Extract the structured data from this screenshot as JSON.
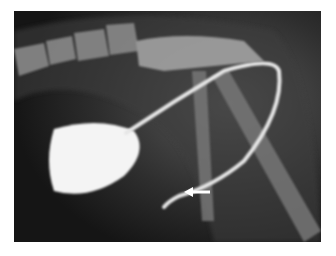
{
  "image": {
    "kind": "radiograph",
    "description": "Lateral contrast radiograph showing contrast-filled bladder and looped urethra/catheter with an arrow indicating a point of interest",
    "annotations": [
      {
        "type": "arrow",
        "direction": "left",
        "color": "#ffffff"
      }
    ]
  },
  "colors": {
    "background": "#ffffff",
    "film": "#1a1a1a",
    "contrast": "#f4f4f4",
    "bone": "#9a9a9a"
  }
}
